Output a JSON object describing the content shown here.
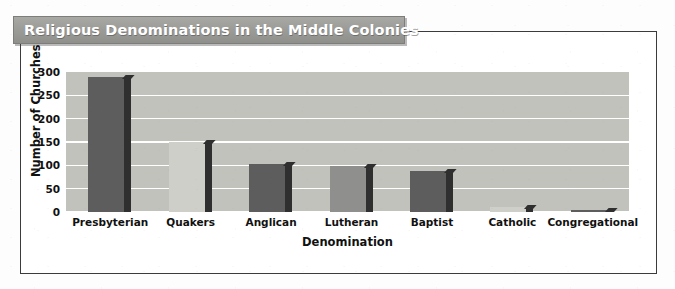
{
  "chart_data": {
    "type": "bar",
    "title": "Religious Denominations in the Middle Colonies",
    "xlabel": "Denomination",
    "ylabel": "Number of Churches",
    "categories": [
      "Presbyterian",
      "Quakers",
      "Anglican",
      "Lutheran",
      "Baptist",
      "Catholic",
      "Congregational"
    ],
    "values": [
      290,
      150,
      103,
      98,
      88,
      10,
      3
    ],
    "ylim": [
      0,
      300
    ],
    "yticks": [
      300,
      250,
      200,
      150,
      100,
      50,
      0
    ],
    "grid": true,
    "legend": "none",
    "bar_styles": [
      "dark",
      "light",
      "dark",
      "medium",
      "dark",
      "light",
      "dark"
    ],
    "colors": {
      "bar_dark": "#5d5d5d",
      "bar_medium": "#8f8f8d",
      "bar_light": "#cfcfc9",
      "bar_side": "#2f2f2f",
      "plot_background": "#c2c2bd",
      "gridline": "#ffffff",
      "title_banner": "#9c9c98",
      "title_text": "#ffffff",
      "frame_border": "#3b3b3b",
      "axis_text": "#111111",
      "page_background": "#ffffff"
    }
  }
}
